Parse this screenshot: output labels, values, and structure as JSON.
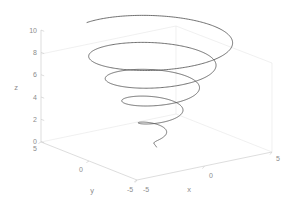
{
  "figure": {
    "background_color": "#ffffff",
    "width": 292,
    "height": 219
  },
  "chart_data": {
    "type": "line",
    "subtype": "3d-parametric-conical-spiral",
    "title": "",
    "xlabel": "x",
    "ylabel": "y",
    "zlabel": "z",
    "xlim": [
      -5,
      5
    ],
    "ylim": [
      -5,
      5
    ],
    "zlim": [
      0,
      10
    ],
    "xticks": [
      -5,
      0,
      5
    ],
    "yticks": [
      -5,
      0,
      5
    ],
    "zticks": [
      0,
      2,
      4,
      6,
      8,
      10
    ],
    "xticklabels": [
      "-5",
      "0",
      "5"
    ],
    "yticklabels": [
      "-5",
      "0",
      "5"
    ],
    "zticklabels": [
      "0",
      "2",
      "4",
      "6",
      "8",
      "10"
    ],
    "grid": false,
    "legend": false,
    "box": false,
    "view": {
      "azimuth": -37.5,
      "elevation": 30
    },
    "line_color": "#4d4d4d",
    "axis_color": "#cfcfcf",
    "tick_label_color": "#8c8c8c",
    "series": [
      {
        "name": "conical spiral",
        "parametric": true,
        "t_start": 0,
        "t_end": 31.4159,
        "turns": 5,
        "equations": {
          "x": "(t/pi) * cos(t)",
          "y": "(t/pi) * sin(t)",
          "z": "t/pi"
        },
        "radius_at_top": 5,
        "radius_at_bottom": 0,
        "z_start": 0,
        "z_end": 10
      }
    ]
  },
  "labels": {
    "x_axis_title": "x",
    "y_axis_title": "y",
    "z_axis_title": "z",
    "x_tick_neg5": "-5",
    "x_tick_0": "0",
    "x_tick_5": "5",
    "y_tick_neg5": "-5",
    "y_tick_0": "0",
    "y_tick_5": "5",
    "z_tick_0": "0",
    "z_tick_2": "2",
    "z_tick_4": "4",
    "z_tick_6": "6",
    "z_tick_8": "8",
    "z_tick_10": "10"
  }
}
